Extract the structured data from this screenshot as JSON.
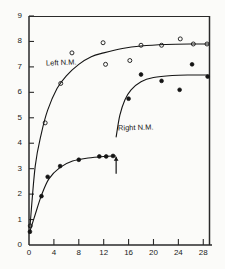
{
  "chart_data": {
    "type": "scatter",
    "title": "",
    "subtitle": "",
    "xlabel": "",
    "ylabel": "",
    "xlim": [
      0,
      29
    ],
    "ylim": [
      0,
      9
    ],
    "grid": false,
    "legend_position": "inline-annotations",
    "xticks": [
      0,
      4,
      8,
      12,
      16,
      20,
      24,
      28
    ],
    "xtick_labels": [
      "0",
      "4",
      "8",
      "12",
      "16",
      "20",
      "24",
      "28"
    ],
    "yticks": [
      0,
      1,
      2,
      3,
      4,
      5,
      6,
      7,
      8,
      9
    ],
    "ytick_labels": [
      "0",
      "1",
      "2",
      "3",
      "4",
      "5",
      "6",
      "7",
      "8",
      "9"
    ],
    "marker_styles": {
      "left": "open-circle",
      "right": "filled-circle"
    },
    "series": [
      {
        "name": "Left N.M.",
        "marker": "open-circle",
        "points": [
          {
            "x": 0.2,
            "y": 0.75
          },
          {
            "x": 2.6,
            "y": 4.8
          },
          {
            "x": 5.1,
            "y": 6.35
          },
          {
            "x": 6.9,
            "y": 7.55
          },
          {
            "x": 11.9,
            "y": 7.95
          },
          {
            "x": 12.3,
            "y": 7.1
          },
          {
            "x": 16.2,
            "y": 7.25
          },
          {
            "x": 18.0,
            "y": 7.85
          },
          {
            "x": 21.3,
            "y": 7.85
          },
          {
            "x": 24.3,
            "y": 8.1
          },
          {
            "x": 26.4,
            "y": 7.9
          },
          {
            "x": 28.6,
            "y": 7.9
          }
        ],
        "fit_curve": [
          {
            "x": 0.15,
            "y": 0.7
          },
          {
            "x": 1.0,
            "y": 3.1
          },
          {
            "x": 2.0,
            "y": 4.4
          },
          {
            "x": 3.0,
            "y": 5.3
          },
          {
            "x": 4.5,
            "y": 6.15
          },
          {
            "x": 6.0,
            "y": 6.65
          },
          {
            "x": 8.0,
            "y": 7.1
          },
          {
            "x": 10.0,
            "y": 7.4
          },
          {
            "x": 12.0,
            "y": 7.55
          },
          {
            "x": 15.0,
            "y": 7.72
          },
          {
            "x": 18.0,
            "y": 7.82
          },
          {
            "x": 22.0,
            "y": 7.88
          },
          {
            "x": 26.0,
            "y": 7.9
          },
          {
            "x": 28.8,
            "y": 7.9
          }
        ]
      },
      {
        "name": "Right N.M.",
        "marker": "filled-circle",
        "points": [
          {
            "x": 0.15,
            "y": 0.52
          },
          {
            "x": 2.0,
            "y": 1.92
          },
          {
            "x": 3.0,
            "y": 2.68
          },
          {
            "x": 5.0,
            "y": 3.1
          },
          {
            "x": 8.0,
            "y": 3.35
          },
          {
            "x": 11.3,
            "y": 3.48
          },
          {
            "x": 12.4,
            "y": 3.48
          },
          {
            "x": 13.5,
            "y": 3.5
          },
          {
            "x": 16.0,
            "y": 5.75
          },
          {
            "x": 18.0,
            "y": 6.7
          },
          {
            "x": 21.3,
            "y": 6.45
          },
          {
            "x": 24.2,
            "y": 6.1
          },
          {
            "x": 26.2,
            "y": 7.1
          },
          {
            "x": 28.7,
            "y": 6.62
          }
        ],
        "fit_curve_a": [
          {
            "x": 0.1,
            "y": 0.5
          },
          {
            "x": 1.0,
            "y": 1.2
          },
          {
            "x": 2.0,
            "y": 1.95
          },
          {
            "x": 3.2,
            "y": 2.6
          },
          {
            "x": 5.0,
            "y": 3.05
          },
          {
            "x": 7.0,
            "y": 3.3
          },
          {
            "x": 9.5,
            "y": 3.42
          },
          {
            "x": 12.0,
            "y": 3.48
          },
          {
            "x": 13.9,
            "y": 3.5
          }
        ],
        "fit_curve_b": [
          {
            "x": 14.0,
            "y": 4.25
          },
          {
            "x": 14.6,
            "y": 5.1
          },
          {
            "x": 15.4,
            "y": 5.7
          },
          {
            "x": 16.4,
            "y": 6.1
          },
          {
            "x": 18.0,
            "y": 6.42
          },
          {
            "x": 20.0,
            "y": 6.58
          },
          {
            "x": 23.0,
            "y": 6.66
          },
          {
            "x": 26.0,
            "y": 6.68
          },
          {
            "x": 28.8,
            "y": 6.68
          }
        ]
      }
    ],
    "annotations": [
      {
        "name": "left-series-label",
        "text": "Left N.M.",
        "x": 3.4,
        "y": 7.1
      },
      {
        "name": "right-series-label",
        "text": "Right N.M.",
        "x": 14.6,
        "y": 4.55
      },
      {
        "name": "treatment-arrow",
        "text": "",
        "x": 14.0,
        "y": 2.8,
        "type": "up-arrow"
      }
    ]
  },
  "colors": {
    "ink": "#141414",
    "axis": "#2a2a2a",
    "background": "#fbfbf9"
  }
}
